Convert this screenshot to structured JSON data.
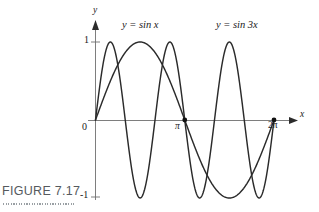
{
  "figure": {
    "caption": "FIGURE 7.17",
    "caption_color": "#555a5e",
    "background": "#ffffff"
  },
  "axes": {
    "y_axis_label": "y",
    "x_axis_label": "x",
    "y_ticks": [
      "1",
      "-1"
    ],
    "origin_label": "0",
    "x_ticks": [
      "π",
      "2π"
    ]
  },
  "curves": {
    "sin_x_label": "y = sin x",
    "sin_3x_label": "y = sin 3x",
    "curve_color": "#2b2b2b"
  },
  "chart_data": {
    "type": "line",
    "title": "",
    "xlabel": "x",
    "ylabel": "y",
    "xlim": [
      0,
      6.283185307179586
    ],
    "ylim": [
      -1,
      1
    ],
    "xtick_values": [
      0,
      3.141592653589793,
      6.283185307179586
    ],
    "xtick_labels": [
      "0",
      "π",
      "2π"
    ],
    "ytick_values": [
      -1,
      0,
      1
    ],
    "ytick_labels": [
      "-1",
      "0",
      "1"
    ],
    "grid": false,
    "legend": "inline-annotations",
    "annotations": [
      {
        "text": "y = sin x",
        "x": 1.1,
        "y": 1.28
      },
      {
        "text": "y = sin 3x",
        "x": 4.55,
        "y": 1.28
      }
    ],
    "markers": [
      {
        "x": 3.141592653589793,
        "y": 0,
        "note": "intersection at pi"
      },
      {
        "x": 6.283185307179586,
        "y": 0,
        "note": "intersection at 2pi"
      }
    ],
    "series": [
      {
        "name": "y = sin x",
        "formula": "sin(x)",
        "x": [
          0,
          0.3141592653589793,
          0.6283185307179586,
          0.9424777960769379,
          1.2566370614359172,
          1.5707963267948966,
          1.8849555921538759,
          2.199114857512855,
          2.5132741228718345,
          2.827433388230814,
          3.141592653589793,
          3.4557519189487724,
          3.7699111843077517,
          4.084070449666731,
          4.39822971502571,
          4.71238898038469,
          5.026548245743669,
          5.340707511102648,
          5.654866776461628,
          5.969026041820607,
          6.283185307179586
        ],
        "y": [
          0,
          0.309,
          0.588,
          0.809,
          0.951,
          1,
          0.951,
          0.809,
          0.588,
          0.309,
          0,
          -0.309,
          -0.588,
          -0.809,
          -0.951,
          -1,
          -0.951,
          -0.809,
          -0.588,
          -0.309,
          0
        ]
      },
      {
        "name": "y = sin 3x",
        "formula": "sin(3x)",
        "x": [
          0,
          0.3141592653589793,
          0.6283185307179586,
          0.9424777960769379,
          1.2566370614359172,
          1.5707963267948966,
          1.8849555921538759,
          2.199114857512855,
          2.5132741228718345,
          2.827433388230814,
          3.141592653589793,
          3.4557519189487724,
          3.7699111843077517,
          4.084070449666731,
          4.39822971502571,
          4.71238898038469,
          5.026548245743669,
          5.340707511102648,
          5.654866776461628,
          5.969026041820607,
          6.283185307179586
        ],
        "y": [
          0,
          0.809,
          0.951,
          0.309,
          -0.588,
          -1,
          -0.588,
          0.309,
          0.951,
          0.809,
          0,
          -0.809,
          -0.951,
          -0.309,
          0.588,
          1,
          0.588,
          -0.309,
          -0.951,
          -0.809,
          0
        ]
      }
    ]
  }
}
